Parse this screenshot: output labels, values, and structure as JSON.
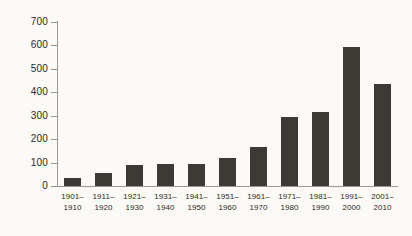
{
  "chart_data": {
    "type": "bar",
    "title": "",
    "subtitle": "",
    "xlabel": "",
    "ylabel": "",
    "categories": [
      "1901–\n1910",
      "1911–\n1920",
      "1921–\n1930",
      "1931–\n1940",
      "1941–\n1950",
      "1951–\n1960",
      "1961–\n1970",
      "1971–\n1980",
      "1981–\n1990",
      "1991–\n2000",
      "2001–\n2010"
    ],
    "category_lines": [
      [
        "1901–",
        "1910"
      ],
      [
        "1911–",
        "1920"
      ],
      [
        "1921–",
        "1930"
      ],
      [
        "1931–",
        "1940"
      ],
      [
        "1941–",
        "1950"
      ],
      [
        "1951–",
        "1960"
      ],
      [
        "1961–",
        "1970"
      ],
      [
        "1971–",
        "1980"
      ],
      [
        "1981–",
        "1990"
      ],
      [
        "1991–",
        "2000"
      ],
      [
        "2001–",
        "2010"
      ]
    ],
    "values": [
      35,
      57,
      90,
      95,
      95,
      118,
      168,
      295,
      315,
      595,
      437
    ],
    "ylim": [
      0,
      700
    ],
    "ytick_values": [
      0,
      100,
      200,
      300,
      400,
      500,
      600,
      700
    ],
    "ytick_labels": [
      "0",
      "100",
      "200",
      "300",
      "400",
      "500",
      "600",
      "700"
    ],
    "grid": false,
    "legend": null,
    "legend_position": "none",
    "bar_color": "#3d3a35",
    "axis_color": "#9a9890",
    "text_color": "#2b2924",
    "background_color": "#fbfaf7"
  }
}
